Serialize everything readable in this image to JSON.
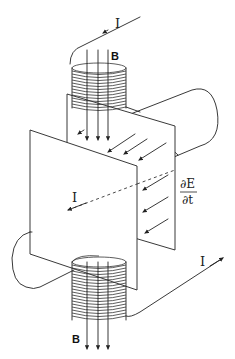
{
  "diagram": {
    "labels": {
      "current_top": "I",
      "current_middle": "I",
      "current_bottom": "I",
      "field_top": "B",
      "field_bottom": "B",
      "dE_numerator": "∂E",
      "dE_denominator": "∂t"
    },
    "components": [
      {
        "name": "top-solenoid",
        "loops": 14,
        "field_arrows": 3
      },
      {
        "name": "bottom-solenoid",
        "loops": 14,
        "field_arrows": 3
      },
      {
        "name": "capacitor-plate-front"
      },
      {
        "name": "capacitor-plate-back"
      },
      {
        "name": "wire-cylinder-right"
      },
      {
        "name": "wire-cylinder-left"
      },
      {
        "name": "electric-field-arrows",
        "count": 7
      }
    ],
    "colors": {
      "line": "#222222",
      "background": "#ffffff"
    }
  }
}
